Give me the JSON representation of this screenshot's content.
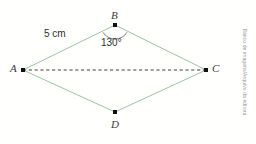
{
  "figure": {
    "type": "geometry-diagram",
    "shape_name": "rhombus ABCD",
    "background_color": "#fffffe",
    "edge_color": "#9dc49d",
    "diagonal_color": "#2b2b2b",
    "vertex_color": "#111111",
    "label_color": "#3a3a3a",
    "vertices": [
      {
        "id": "A",
        "label": "A",
        "x": 23,
        "y": 70,
        "label_x": 10,
        "label_y": 64
      },
      {
        "id": "B",
        "label": "B",
        "x": 115,
        "y": 25,
        "label_x": 111,
        "label_y": 11
      },
      {
        "id": "C",
        "label": "C",
        "x": 206,
        "y": 70,
        "label_x": 213,
        "label_y": 64
      },
      {
        "id": "D",
        "label": "D",
        "x": 115,
        "y": 112,
        "label_x": 111,
        "label_y": 120
      }
    ],
    "edges": [
      {
        "from": "A",
        "to": "B",
        "style": "solid"
      },
      {
        "from": "B",
        "to": "C",
        "style": "solid"
      },
      {
        "from": "C",
        "to": "D",
        "style": "solid"
      },
      {
        "from": "D",
        "to": "A",
        "style": "solid"
      }
    ],
    "diagonal": {
      "from": "A",
      "to": "C",
      "style": "dashed"
    },
    "side_label": {
      "text": "5 cm",
      "x": 45,
      "y": 30
    },
    "angle": {
      "at_vertex": "B",
      "text": "130°",
      "label_x": 101,
      "label_y": 39,
      "arc_radius": 15
    }
  },
  "credit": {
    "text": "Banco de imagens/Arquivo da editora"
  }
}
